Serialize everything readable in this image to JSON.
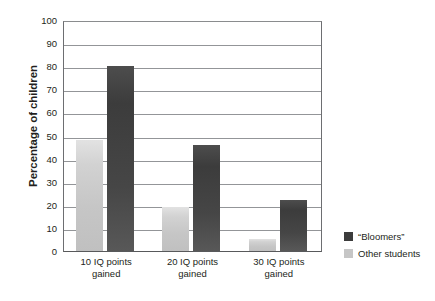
{
  "chart_data": {
    "type": "bar",
    "title": "",
    "xlabel": "",
    "ylabel": "Percentage of children",
    "ylim": [
      0,
      100
    ],
    "ytick_step": 10,
    "yticks": [
      100,
      90,
      80,
      70,
      60,
      50,
      40,
      30,
      20,
      10,
      0
    ],
    "grid": true,
    "legend_position": "right-bottom",
    "categories": [
      "10 IQ points\ngained",
      "20 IQ points\ngained",
      "30 IQ points\ngained"
    ],
    "category_lines": [
      [
        "10 IQ points",
        "gained"
      ],
      [
        "20 IQ points",
        "gained"
      ],
      [
        "30 IQ points",
        "gained"
      ]
    ],
    "series": [
      {
        "name": "“Bloomers”",
        "color": "#3c3c3c",
        "values": [
          80,
          46,
          22
        ]
      },
      {
        "name": "Other students",
        "color": "#c6c6c6",
        "values": [
          48,
          19,
          5
        ]
      }
    ]
  },
  "legend": {
    "items": [
      {
        "label": "“Bloomers”",
        "color": "#3c3c3c"
      },
      {
        "label": "Other students",
        "color": "#c6c6c6"
      }
    ]
  },
  "colors": {
    "bar_dark": "#3c3c3c",
    "bar_light": "#c6c6c6",
    "gridline": "#939598",
    "axis": "#58595b",
    "text": "#231f20",
    "background": "#ffffff"
  }
}
